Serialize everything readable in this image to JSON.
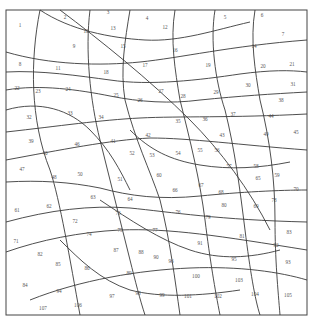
{
  "puzzle": {
    "type": "color-by-number",
    "regions": [
      {
        "n": "1",
        "x": 20,
        "y": 27
      },
      {
        "n": "2",
        "x": 65,
        "y": 19
      },
      {
        "n": "3",
        "x": 108,
        "y": 14
      },
      {
        "n": "4",
        "x": 147,
        "y": 20
      },
      {
        "n": "5",
        "x": 225,
        "y": 19
      },
      {
        "n": "6",
        "x": 262,
        "y": 17
      },
      {
        "n": "7",
        "x": 283,
        "y": 36
      },
      {
        "n": "8",
        "x": 20,
        "y": 66
      },
      {
        "n": "9",
        "x": 74,
        "y": 48
      },
      {
        "n": "10",
        "x": 86,
        "y": 33
      },
      {
        "n": "11",
        "x": 58,
        "y": 70
      },
      {
        "n": "12",
        "x": 165,
        "y": 29
      },
      {
        "n": "13",
        "x": 113,
        "y": 30
      },
      {
        "n": "14",
        "x": 254,
        "y": 48
      },
      {
        "n": "15",
        "x": 123,
        "y": 48
      },
      {
        "n": "16",
        "x": 175,
        "y": 52
      },
      {
        "n": "17",
        "x": 145,
        "y": 67
      },
      {
        "n": "18",
        "x": 106,
        "y": 74
      },
      {
        "n": "19",
        "x": 208,
        "y": 67
      },
      {
        "n": "20",
        "x": 263,
        "y": 68
      },
      {
        "n": "21",
        "x": 292,
        "y": 66
      },
      {
        "n": "22",
        "x": 17,
        "y": 90
      },
      {
        "n": "23",
        "x": 38,
        "y": 93
      },
      {
        "n": "24",
        "x": 68,
        "y": 91
      },
      {
        "n": "25",
        "x": 116,
        "y": 97
      },
      {
        "n": "26",
        "x": 140,
        "y": 102
      },
      {
        "n": "27",
        "x": 161,
        "y": 93
      },
      {
        "n": "28",
        "x": 183,
        "y": 98
      },
      {
        "n": "29",
        "x": 216,
        "y": 94
      },
      {
        "n": "30",
        "x": 248,
        "y": 87
      },
      {
        "n": "31",
        "x": 293,
        "y": 86
      },
      {
        "n": "32",
        "x": 29,
        "y": 119
      },
      {
        "n": "33",
        "x": 70,
        "y": 115
      },
      {
        "n": "34",
        "x": 101,
        "y": 119
      },
      {
        "n": "35",
        "x": 178,
        "y": 123
      },
      {
        "n": "36",
        "x": 205,
        "y": 121
      },
      {
        "n": "37",
        "x": 233,
        "y": 116
      },
      {
        "n": "38",
        "x": 281,
        "y": 102
      },
      {
        "n": "39",
        "x": 31,
        "y": 143
      },
      {
        "n": "40",
        "x": 45,
        "y": 155
      },
      {
        "n": "41",
        "x": 113,
        "y": 143
      },
      {
        "n": "42",
        "x": 148,
        "y": 137
      },
      {
        "n": "43",
        "x": 222,
        "y": 137
      },
      {
        "n": "44",
        "x": 271,
        "y": 118
      },
      {
        "n": "45",
        "x": 296,
        "y": 134
      },
      {
        "n": "46",
        "x": 77,
        "y": 146
      },
      {
        "n": "47",
        "x": 22,
        "y": 171
      },
      {
        "n": "48",
        "x": 54,
        "y": 179
      },
      {
        "n": "49",
        "x": 266,
        "y": 136
      },
      {
        "n": "50",
        "x": 80,
        "y": 176
      },
      {
        "n": "51",
        "x": 120,
        "y": 181
      },
      {
        "n": "52",
        "x": 132,
        "y": 155
      },
      {
        "n": "53",
        "x": 152,
        "y": 157
      },
      {
        "n": "54",
        "x": 178,
        "y": 155
      },
      {
        "n": "55",
        "x": 200,
        "y": 152
      },
      {
        "n": "56",
        "x": 217,
        "y": 152
      },
      {
        "n": "57",
        "x": 229,
        "y": 168
      },
      {
        "n": "58",
        "x": 256,
        "y": 168
      },
      {
        "n": "59",
        "x": 277,
        "y": 177
      },
      {
        "n": "60",
        "x": 159,
        "y": 177
      },
      {
        "n": "61",
        "x": 17,
        "y": 212
      },
      {
        "n": "62",
        "x": 49,
        "y": 208
      },
      {
        "n": "63",
        "x": 93,
        "y": 199
      },
      {
        "n": "64",
        "x": 130,
        "y": 201
      },
      {
        "n": "65",
        "x": 258,
        "y": 180
      },
      {
        "n": "66",
        "x": 175,
        "y": 192
      },
      {
        "n": "67",
        "x": 201,
        "y": 187
      },
      {
        "n": "68",
        "x": 221,
        "y": 194
      },
      {
        "n": "69",
        "x": 256,
        "y": 208
      },
      {
        "n": "70",
        "x": 296,
        "y": 191
      },
      {
        "n": "71",
        "x": 16,
        "y": 243
      },
      {
        "n": "72",
        "x": 75,
        "y": 223
      },
      {
        "n": "73",
        "x": 118,
        "y": 215
      },
      {
        "n": "74",
        "x": 89,
        "y": 236
      },
      {
        "n": "75",
        "x": 120,
        "y": 232
      },
      {
        "n": "76",
        "x": 178,
        "y": 214
      },
      {
        "n": "77",
        "x": 155,
        "y": 232
      },
      {
        "n": "78",
        "x": 274,
        "y": 202
      },
      {
        "n": "79",
        "x": 208,
        "y": 219
      },
      {
        "n": "80",
        "x": 224,
        "y": 207
      },
      {
        "n": "81",
        "x": 242,
        "y": 238
      },
      {
        "n": "82",
        "x": 40,
        "y": 256
      },
      {
        "n": "83",
        "x": 289,
        "y": 234
      },
      {
        "n": "84",
        "x": 25,
        "y": 287
      },
      {
        "n": "85",
        "x": 58,
        "y": 266
      },
      {
        "n": "86",
        "x": 87,
        "y": 270
      },
      {
        "n": "87",
        "x": 116,
        "y": 252
      },
      {
        "n": "88",
        "x": 141,
        "y": 254
      },
      {
        "n": "89",
        "x": 129,
        "y": 275
      },
      {
        "n": "90",
        "x": 156,
        "y": 259
      },
      {
        "n": "91",
        "x": 200,
        "y": 245
      },
      {
        "n": "92",
        "x": 276,
        "y": 247
      },
      {
        "n": "93",
        "x": 288,
        "y": 264
      },
      {
        "n": "94",
        "x": 59,
        "y": 293
      },
      {
        "n": "95",
        "x": 234,
        "y": 261
      },
      {
        "n": "96",
        "x": 171,
        "y": 263
      },
      {
        "n": "97",
        "x": 112,
        "y": 298
      },
      {
        "n": "98",
        "x": 138,
        "y": 295
      },
      {
        "n": "99",
        "x": 162,
        "y": 297
      },
      {
        "n": "100",
        "x": 196,
        "y": 278
      },
      {
        "n": "101",
        "x": 188,
        "y": 298
      },
      {
        "n": "102",
        "x": 218,
        "y": 298
      },
      {
        "n": "103",
        "x": 239,
        "y": 282
      },
      {
        "n": "104",
        "x": 255,
        "y": 296
      },
      {
        "n": "105",
        "x": 288,
        "y": 297
      },
      {
        "n": "106",
        "x": 78,
        "y": 307
      },
      {
        "n": "107",
        "x": 43,
        "y": 310
      }
    ]
  }
}
